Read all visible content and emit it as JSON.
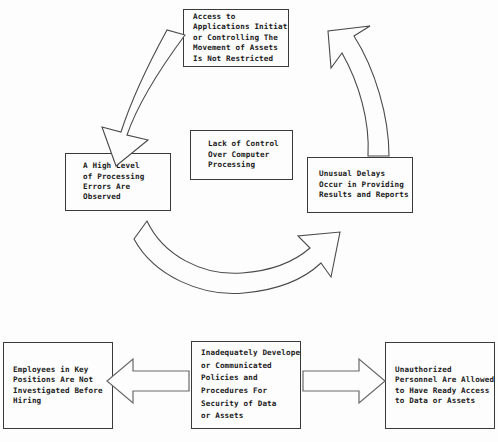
{
  "diagram": {
    "title": "Lack of Control Over Computer Processing",
    "colors": {
      "background": "#fdfdfd",
      "box_border": "#3a3a3a",
      "text": "#1a1a1a",
      "arrow_stroke": "#4a4a4a"
    },
    "boxes": {
      "top": {
        "name": "access-to-applications",
        "lines": [
          "Access to",
          "Applications Initiating",
          "or Controlling The",
          "Movement of Assets",
          "Is Not Restricted"
        ]
      },
      "center": {
        "name": "lack-of-control",
        "lines": [
          "Lack of Control",
          "Over Computer",
          "Processing"
        ]
      },
      "left": {
        "name": "high-level-processing-errors",
        "lines": [
          "A High Level",
          "of Processing",
          "Errors Are",
          "Observed"
        ]
      },
      "right": {
        "name": "unusual-delays",
        "lines": [
          "Unusual Delays",
          "Occur in Providing",
          "Results and Reports"
        ]
      },
      "bottom_left": {
        "name": "employees-not-investigated",
        "lines": [
          "Employees in Key",
          "Positions Are Not",
          "Investigated Before",
          "Hiring"
        ]
      },
      "bottom_center": {
        "name": "inadequate-policies",
        "lines": [
          "Inadequately Developed",
          "or Communicated",
          "Policies and",
          "Procedures For",
          "Security of Data",
          "or Assets"
        ]
      },
      "bottom_right": {
        "name": "unauthorized-personnel",
        "lines": [
          "Unauthorized",
          "Personnel Are Allowed",
          "to Have Ready Access",
          "to Data or Assets"
        ]
      }
    },
    "arrows": [
      {
        "name": "curved-arrow-top-left",
        "direction": "down-left",
        "style": "curved-block"
      },
      {
        "name": "curved-arrow-top-right",
        "direction": "up-left",
        "style": "curved-block"
      },
      {
        "name": "curved-arrow-bottom",
        "direction": "right-up",
        "style": "curved-block"
      },
      {
        "name": "arrow-left",
        "direction": "left",
        "style": "straight-block"
      },
      {
        "name": "arrow-right",
        "direction": "right",
        "style": "straight-block"
      }
    ]
  }
}
